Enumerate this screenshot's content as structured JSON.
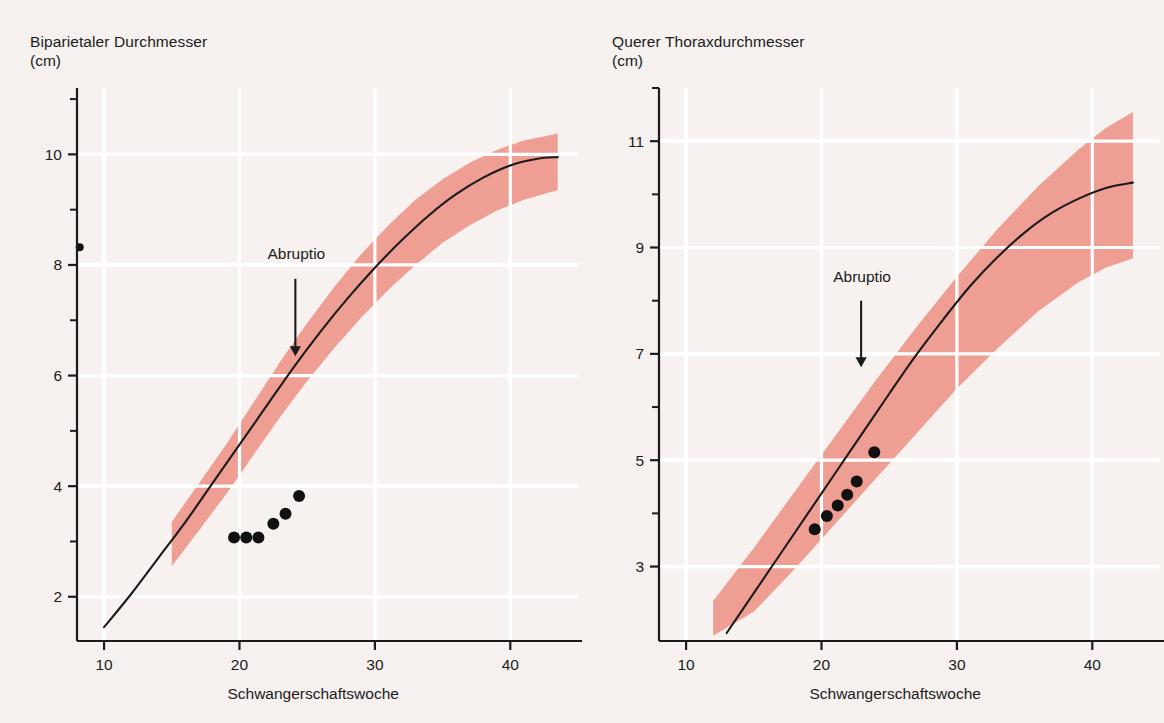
{
  "page": {
    "background_color": "#f6f1ef",
    "band_color": "#ef9e93",
    "grid_color": "#ffffff",
    "ink_color": "#1b1b1b"
  },
  "charts": [
    {
      "id": "biparietal-diameter",
      "chart_data": {
        "type": "line",
        "title": "Biparietaler Durchmesser",
        "subtitle": "(cm)",
        "xlabel": "Schwangerschaftswoche",
        "ylabel": "(cm)",
        "xlim": [
          8,
          45
        ],
        "ylim": [
          1.2,
          11.2
        ],
        "xticks": [
          10,
          20,
          30,
          40
        ],
        "xticklabels": [
          "10",
          "20",
          "30",
          "40"
        ],
        "xminorticks": [
          15,
          25,
          35
        ],
        "yticks": [
          2,
          4,
          6,
          8,
          10
        ],
        "yticklabels": [
          "2",
          "4",
          "6",
          "8",
          "10"
        ],
        "yminorticks": [
          3,
          5,
          7,
          9,
          11
        ],
        "grid": "major-white",
        "legend": "none",
        "series": [
          {
            "name": "Median (50. Perzentile)",
            "type": "line",
            "color": "#1b1b1b",
            "x": [
              10,
              12,
              14,
              16,
              18,
              20,
              22,
              24,
              26,
              28,
              30,
              32,
              34,
              36,
              38,
              40,
              42,
              43.5
            ],
            "values": [
              1.45,
              2.05,
              2.7,
              3.35,
              4.05,
              4.75,
              5.45,
              6.15,
              6.8,
              7.4,
              7.95,
              8.45,
              8.9,
              9.28,
              9.58,
              9.8,
              9.92,
              9.95
            ]
          },
          {
            "name": "Normbereich (Streubereich)",
            "type": "band",
            "color": "#ef9e93",
            "x": [
              15,
              17,
              19,
              21,
              23,
              25,
              27,
              29,
              31,
              33,
              35,
              37,
              39,
              41,
              43,
              43.5
            ],
            "lower": [
              2.55,
              3.2,
              3.85,
              4.55,
              5.25,
              5.9,
              6.5,
              7.05,
              7.55,
              8.0,
              8.4,
              8.72,
              8.98,
              9.18,
              9.32,
              9.35
            ],
            "upper": [
              3.35,
              4.05,
              4.75,
              5.5,
              6.25,
              6.95,
              7.6,
              8.2,
              8.72,
              9.18,
              9.55,
              9.85,
              10.08,
              10.25,
              10.35,
              10.38
            ]
          },
          {
            "name": "Messwerte Patientin",
            "type": "scatter",
            "color": "#111111",
            "x": [
              19.6,
              20.5,
              21.4,
              22.5,
              23.4,
              24.4
            ],
            "values": [
              3.07,
              3.07,
              3.07,
              3.32,
              3.5,
              3.82
            ]
          },
          {
            "name": "Einzelpunkt an der Achse",
            "type": "scatter",
            "color": "#111111",
            "x": [
              8.2
            ],
            "values": [
              8.32
            ]
          }
        ],
        "annotations": [
          {
            "text": "Abruptio",
            "x": 24.2,
            "y": 8.1,
            "arrow": "down",
            "arrow_from_y": 7.75,
            "arrow_to_y": 6.35
          }
        ]
      }
    },
    {
      "id": "transverse-thoracic-diameter",
      "chart_data": {
        "type": "line",
        "title": "Querer Thoraxdurchmesser",
        "subtitle": "(cm)",
        "xlabel": "Schwangerschaftswoche",
        "ylabel": "(cm)",
        "xlim": [
          8,
          45
        ],
        "ylim": [
          1.6,
          12.0
        ],
        "xticks": [
          10,
          20,
          30,
          40
        ],
        "xticklabels": [
          "10",
          "20",
          "30",
          "40"
        ],
        "xminorticks": [
          15,
          25,
          35
        ],
        "yticks": [
          3,
          5,
          7,
          9,
          11
        ],
        "yticklabels": [
          "3",
          "5",
          "7",
          "9",
          "11"
        ],
        "yminorticks": [
          4,
          6,
          8,
          10,
          12
        ],
        "grid": "major-white",
        "legend": "none",
        "series": [
          {
            "name": "Median (50. Perzentile)",
            "type": "line",
            "color": "#1b1b1b",
            "x": [
              13,
              15,
              17,
              19,
              21,
              23,
              25,
              27,
              29,
              31,
              33,
              35,
              37,
              39,
              41,
              43
            ],
            "values": [
              1.75,
              2.5,
              3.25,
              4.0,
              4.75,
              5.5,
              6.25,
              6.98,
              7.65,
              8.28,
              8.82,
              9.28,
              9.65,
              9.92,
              10.12,
              10.22
            ]
          },
          {
            "name": "Normbereich (Streubereich)",
            "type": "band",
            "color": "#ef9e93",
            "x": [
              12,
              15,
              18,
              21,
              24,
              27,
              30,
              33,
              36,
              39,
              41,
              43
            ],
            "lower": [
              1.7,
              2.15,
              2.95,
              3.8,
              4.65,
              5.5,
              6.35,
              7.1,
              7.8,
              8.35,
              8.62,
              8.8
            ],
            "upper": [
              2.35,
              3.35,
              4.4,
              5.45,
              6.5,
              7.5,
              8.45,
              9.35,
              10.15,
              10.85,
              11.25,
              11.55
            ]
          },
          {
            "name": "Messwerte Patientin",
            "type": "scatter",
            "color": "#111111",
            "x": [
              19.5,
              20.4,
              21.2,
              21.9,
              22.6,
              23.9
            ],
            "values": [
              3.7,
              3.95,
              4.15,
              4.35,
              4.6,
              5.15
            ]
          }
        ],
        "annotations": [
          {
            "text": "Abruptio",
            "x": 23.0,
            "y": 8.35,
            "arrow": "down",
            "arrow_from_y": 8.0,
            "arrow_to_y": 6.75
          }
        ]
      }
    }
  ]
}
